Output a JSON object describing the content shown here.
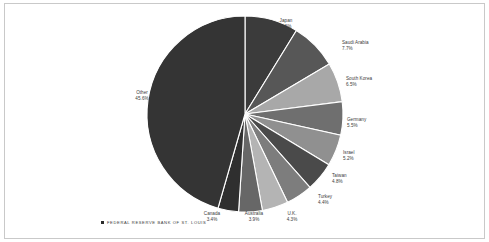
{
  "chart_data": {
    "type": "pie",
    "title": "",
    "subtitle": "",
    "xlabel": "",
    "ylabel": "",
    "grid": false,
    "legend_position": "none",
    "labels_on_slices": true,
    "start_angle_deg": 0,
    "direction": "clockwise",
    "categories": [
      "Japan",
      "Saudi Arabia",
      "South Korea",
      "Germany",
      "Israel",
      "Taiwan",
      "Turkey",
      "U.K.",
      "Australia",
      "Canada",
      "Other"
    ],
    "values": [
      8.8,
      7.7,
      6.5,
      5.5,
      5.2,
      4.8,
      4.4,
      4.3,
      3.9,
      3.4,
      45.6
    ],
    "value_unit": "%",
    "slices": [
      {
        "name": "Japan",
        "pct": "8.8%",
        "value": 8.8,
        "color": "#3b3b3b"
      },
      {
        "name": "Saudi Arabia",
        "pct": "7.7%",
        "value": 7.7,
        "color": "#575757"
      },
      {
        "name": "South Korea",
        "pct": "6.5%",
        "value": 6.5,
        "color": "#a8a8a8"
      },
      {
        "name": "Germany",
        "pct": "5.5%",
        "value": 5.5,
        "color": "#6f6f6f"
      },
      {
        "name": "Israel",
        "pct": "5.2%",
        "value": 5.2,
        "color": "#909090"
      },
      {
        "name": "Taiwan",
        "pct": "4.8%",
        "value": 4.8,
        "color": "#4a4a4a"
      },
      {
        "name": "Turkey",
        "pct": "4.4%",
        "value": 4.4,
        "color": "#7d7d7d"
      },
      {
        "name": "U.K.",
        "pct": "4.3%",
        "value": 4.3,
        "color": "#b4b4b4"
      },
      {
        "name": "Australia",
        "pct": "3.9%",
        "value": 3.9,
        "color": "#676767"
      },
      {
        "name": "Canada",
        "pct": "3.4%",
        "value": 3.4,
        "color": "#2f2f2f"
      },
      {
        "name": "Other",
        "pct": "45.6%",
        "value": 45.6,
        "color": "#343434"
      }
    ]
  },
  "footer": {
    "source_label": "FEDERAL RESERVE BANK OF ST. LOUIS"
  },
  "style": {
    "separator_color": "#ffffff",
    "frame_color": "#c9c9c9",
    "background": "#ffffff",
    "label_color": "#3a3a3a"
  }
}
